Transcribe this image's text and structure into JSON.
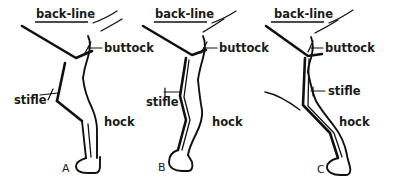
{
  "figure": {
    "width": 398,
    "height": 185,
    "background_color": "#ffffff",
    "ink_color": "#101010",
    "panel_count": 3
  },
  "labels": {
    "back_line": "back-line",
    "buttock": "buttock",
    "stifle": "stifle",
    "hock": "hock"
  },
  "panels": [
    {
      "id": "A",
      "letter": "A",
      "annotations": {
        "back_line": "back-line",
        "buttock": "buttock",
        "stifle": "stifle",
        "hock": "hock"
      }
    },
    {
      "id": "B",
      "letter": "B",
      "annotations": {
        "back_line": "back-line",
        "buttock": "buttock",
        "stifle": "stifle",
        "hock": "hock"
      }
    },
    {
      "id": "C",
      "letter": "C",
      "annotations": {
        "back_line": "back-line",
        "buttock": "buttock",
        "stifle": "stifle",
        "hock": "hock"
      }
    }
  ]
}
